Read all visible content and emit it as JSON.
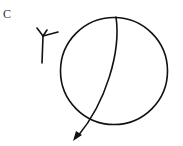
{
  "panel_label": "C",
  "diagram": {
    "circle": {
      "cx": 114,
      "cy": 71,
      "r": 53.5
    },
    "arc_path": "M116,17 C120,50 105,100 78,138",
    "arrowhead": "M72,140 L84,131 L79,130 Z",
    "symbol": {
      "stem": "M42,63 L43,36",
      "branches": [
        "M43,36 L37,28",
        "M43,36 L58,32",
        "M43,36 L47,29"
      ]
    },
    "stroke_color": "#111111"
  }
}
